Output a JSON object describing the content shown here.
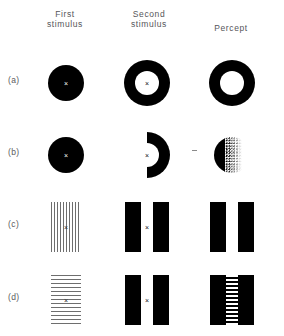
{
  "figure": {
    "columns": [
      {
        "line1": "First",
        "line2": "stimulus"
      },
      {
        "line1": "Second",
        "line2": "stimulus"
      },
      {
        "line1": "Percept",
        "line2": ""
      }
    ],
    "fixation_symbol": "×",
    "colors": {
      "ink": "#000000",
      "paper": "#ffffff",
      "label": "#56565a",
      "grating": "#6e6e6e"
    },
    "rows": [
      {
        "label": "(a)",
        "cells": [
          {
            "shape": "filled-disk",
            "caption": "filled black disk with central fixation cross",
            "fixation": true
          },
          {
            "shape": "annulus",
            "caption": "black ring with white centre and fixation cross",
            "fixation": true
          },
          {
            "shape": "annulus",
            "caption": "black ring percept",
            "fixation": false
          }
        ]
      },
      {
        "label": "(b)",
        "cells": [
          {
            "shape": "filled-disk",
            "caption": "filled black disk with central fixation cross",
            "fixation": true
          },
          {
            "shape": "half-annulus-right",
            "caption": "right half ring, opening to the left, fixation cross at centre",
            "fixation": true
          },
          {
            "shape": "stippled-half-disk",
            "caption": "stippled half disk percept fading to the right",
            "fixation": false
          }
        ]
      },
      {
        "label": "(c)",
        "cells": [
          {
            "shape": "vertical-grating",
            "caption": "vertical line grating with central fixation cross",
            "fixation": true
          },
          {
            "shape": "bar-pair",
            "caption": "two black bars separated by a gap with fixation cross",
            "fixation": true
          },
          {
            "shape": "bar-pair",
            "caption": "two black bars percept, gap remains blank",
            "fixation": false
          }
        ]
      },
      {
        "label": "(d)",
        "cells": [
          {
            "shape": "horizontal-grating",
            "caption": "horizontal line grating with central fixation cross",
            "fixation": true
          },
          {
            "shape": "bar-pair",
            "caption": "two black bars separated by a gap with fixation cross",
            "fixation": true
          },
          {
            "shape": "bar-pair-striped-gap",
            "caption": "two black bars with horizontal stripes filling the gap",
            "fixation": false
          }
        ]
      }
    ]
  }
}
